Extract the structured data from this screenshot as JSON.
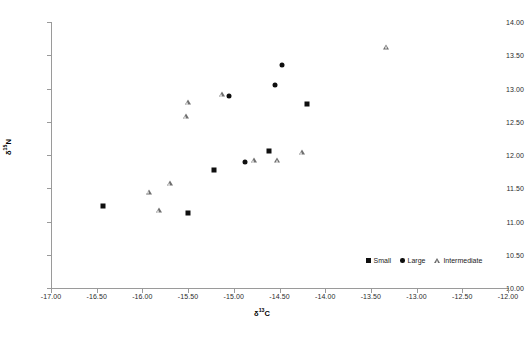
{
  "chart_data": {
    "type": "scatter",
    "title": "",
    "xlabel": "δ13C",
    "ylabel": "δ15N",
    "xlabel_base": "δ",
    "xlabel_sup": "13",
    "xlabel_tail": "C",
    "ylabel_base": "δ",
    "ylabel_sup": "15",
    "ylabel_tail": "N",
    "xlim": [
      -17.0,
      -12.0
    ],
    "ylim": [
      10.0,
      14.0
    ],
    "xticks": [
      "-17.00",
      "-16.50",
      "-16.00",
      "-15.50",
      "-15.00",
      "-14.50",
      "-14.00",
      "-13.50",
      "-13.00",
      "-12.50",
      "-12.00"
    ],
    "xtick_values": [
      -17.0,
      -16.5,
      -16.0,
      -15.5,
      -15.0,
      -14.5,
      -14.0,
      -13.5,
      -13.0,
      -12.5,
      -12.0
    ],
    "yticks": [
      "10.00",
      "10.50",
      "11.00",
      "11.50",
      "12.00",
      "12.50",
      "13.00",
      "13.50",
      "14.00"
    ],
    "ytick_values": [
      10.0,
      10.5,
      11.0,
      11.5,
      12.0,
      12.5,
      13.0,
      13.5,
      14.0
    ],
    "grid": false,
    "legend_position": "bottom-right",
    "series": [
      {
        "name": "Small",
        "marker": "square",
        "color": "#0f0f0f",
        "points": [
          {
            "x": -16.43,
            "y": 11.23
          },
          {
            "x": -15.5,
            "y": 11.13
          },
          {
            "x": -15.22,
            "y": 11.77
          },
          {
            "x": -14.62,
            "y": 12.06
          },
          {
            "x": -14.2,
            "y": 12.76
          }
        ]
      },
      {
        "name": "Large",
        "marker": "circle",
        "color": "#0f0f0f",
        "points": [
          {
            "x": -14.88,
            "y": 11.89
          },
          {
            "x": -15.05,
            "y": 12.88
          },
          {
            "x": -14.55,
            "y": 13.06
          },
          {
            "x": -14.47,
            "y": 13.35
          }
        ]
      },
      {
        "name": "Intermediate",
        "marker": "triangle",
        "color": "#6e6e6e",
        "points": [
          {
            "x": -15.93,
            "y": 11.45
          },
          {
            "x": -15.82,
            "y": 11.17
          },
          {
            "x": -15.7,
            "y": 11.58
          },
          {
            "x": -15.5,
            "y": 12.8
          },
          {
            "x": -15.52,
            "y": 12.58
          },
          {
            "x": -15.13,
            "y": 12.91
          },
          {
            "x": -14.78,
            "y": 11.92
          },
          {
            "x": -14.52,
            "y": 11.93
          },
          {
            "x": -14.25,
            "y": 12.04
          },
          {
            "x": -13.33,
            "y": 13.63
          }
        ]
      }
    ],
    "legend": [
      {
        "label": "Small",
        "marker": "square"
      },
      {
        "label": "Large",
        "marker": "circle"
      },
      {
        "label": "Intermediate",
        "marker": "triangle"
      }
    ]
  }
}
